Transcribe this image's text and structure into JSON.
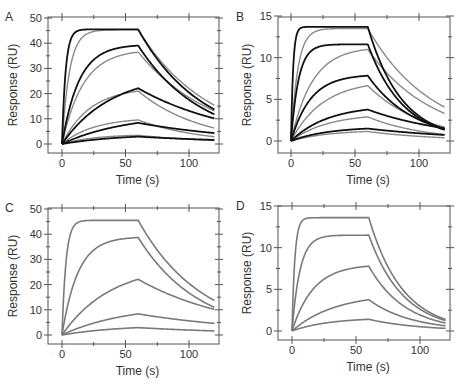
{
  "figure": {
    "panels": [
      "A",
      "B",
      "C",
      "D"
    ]
  },
  "chart_data": [
    {
      "panel": "A",
      "type": "line",
      "xlabel": "Time (s)",
      "ylabel": "Response (RU)",
      "xlim": [
        -8,
        125
      ],
      "ylim": [
        -2,
        50
      ],
      "xticks": [
        0,
        50,
        100
      ],
      "yticks": [
        0,
        10,
        20,
        30,
        40,
        50
      ],
      "injection_end_s": 60,
      "end_s": 120,
      "grid": false,
      "legend": "none",
      "series_groups": [
        {
          "name": "fit",
          "color": "#111111",
          "width": 1.8,
          "curves": [
            {
              "plateau": 45.5,
              "kon": 0.35,
              "koff": 0.02
            },
            {
              "plateau": 39.5,
              "kon": 0.075,
              "koff": 0.02
            },
            {
              "plateau": 28.0,
              "kon": 0.026,
              "koff": 0.013
            },
            {
              "plateau": 12.0,
              "kon": 0.02,
              "koff": 0.011
            },
            {
              "plateau": 4.0,
              "kon": 0.022,
              "koff": 0.01
            }
          ]
        },
        {
          "name": "data",
          "color": "#8a8a8a",
          "width": 1.4,
          "curves": [
            {
              "plateau": 45.3,
              "kon": 0.17,
              "koff": 0.018
            },
            {
              "plateau": 37.5,
              "kon": 0.06,
              "koff": 0.017
            },
            {
              "plateau": 22.5,
              "kon": 0.045,
              "koff": 0.02
            },
            {
              "plateau": 10.5,
              "kon": 0.04,
              "koff": 0.02
            },
            {
              "plateau": 3.8,
              "kon": 0.04,
              "koff": 0.015
            }
          ]
        }
      ]
    },
    {
      "panel": "B",
      "type": "line",
      "xlabel": "Time (s)",
      "ylabel": "Response (RU)",
      "xlim": [
        -8,
        127
      ],
      "ylim": [
        -0.6,
        15
      ],
      "xticks": [
        0,
        50,
        100
      ],
      "yticks": [
        0,
        5,
        10,
        15
      ],
      "injection_end_s": 60,
      "end_s": 120,
      "grid": false,
      "legend": "none",
      "series_groups": [
        {
          "name": "fit",
          "color": "#111111",
          "width": 1.8,
          "curves": [
            {
              "plateau": 13.7,
              "kon": 0.6,
              "koff": 0.038
            },
            {
              "plateau": 11.6,
              "kon": 0.17,
              "koff": 0.036
            },
            {
              "plateau": 8.0,
              "kon": 0.065,
              "koff": 0.028
            },
            {
              "plateau": 4.3,
              "kon": 0.035,
              "koff": 0.015
            },
            {
              "plateau": 1.7,
              "kon": 0.035,
              "koff": 0.012
            }
          ]
        },
        {
          "name": "data",
          "color": "#8a8a8a",
          "width": 1.4,
          "curves": [
            {
              "plateau": 13.5,
              "kon": 0.19,
              "koff": 0.02
            },
            {
              "plateau": 11.3,
              "kon": 0.06,
              "koff": 0.02
            },
            {
              "plateau": 7.3,
              "kon": 0.04,
              "koff": 0.023
            },
            {
              "plateau": 3.3,
              "kon": 0.035,
              "koff": 0.022
            },
            {
              "plateau": 1.3,
              "kon": 0.035,
              "koff": 0.018
            }
          ]
        }
      ]
    },
    {
      "panel": "C",
      "type": "line",
      "xlabel": "Time (s)",
      "ylabel": "Response (RU)",
      "xlim": [
        -8,
        125
      ],
      "ylim": [
        -2,
        50
      ],
      "xticks": [
        0,
        50,
        100
      ],
      "yticks": [
        0,
        10,
        20,
        30,
        40,
        50
      ],
      "injection_end_s": 60,
      "end_s": 120,
      "grid": false,
      "legend": "none",
      "series_groups": [
        {
          "name": "simulated",
          "color": "#7a7a7a",
          "width": 1.6,
          "curves": [
            {
              "plateau": 45.5,
              "kon": 0.32,
              "koff": 0.02
            },
            {
              "plateau": 39.0,
              "kon": 0.08,
              "koff": 0.021
            },
            {
              "plateau": 28.0,
              "kon": 0.026,
              "koff": 0.013
            },
            {
              "plateau": 12.0,
              "kon": 0.02,
              "koff": 0.01
            },
            {
              "plateau": 4.0,
              "kon": 0.022,
              "koff": 0.01
            }
          ]
        }
      ]
    },
    {
      "panel": "D",
      "type": "line",
      "xlabel": "Time (s)",
      "ylabel": "Response (RU)",
      "xlim": [
        -8,
        125
      ],
      "ylim": [
        -0.6,
        15
      ],
      "xticks": [
        0,
        50,
        100
      ],
      "yticks": [
        0,
        5,
        10,
        15
      ],
      "injection_end_s": 60,
      "end_s": 120,
      "grid": false,
      "legend": "none",
      "series_groups": [
        {
          "name": "simulated",
          "color": "#7a7a7a",
          "width": 1.6,
          "curves": [
            {
              "plateau": 13.6,
              "kon": 0.45,
              "koff": 0.038
            },
            {
              "plateau": 11.5,
              "kon": 0.16,
              "koff": 0.037
            },
            {
              "plateau": 8.0,
              "kon": 0.06,
              "koff": 0.035
            },
            {
              "plateau": 4.5,
              "kon": 0.03,
              "koff": 0.03
            },
            {
              "plateau": 1.6,
              "kon": 0.035,
              "koff": 0.025
            }
          ]
        }
      ]
    }
  ],
  "layout": {
    "panels": [
      {
        "left": 48,
        "top": 17,
        "right": 219,
        "bottom": 153,
        "x0": 62,
        "x100": 189,
        "y_top_val_px": 18,
        "y_zero_px": 144
      },
      {
        "left": 278,
        "top": 17,
        "right": 450,
        "bottom": 153,
        "x0": 291,
        "x100": 419,
        "y_top_val_px": 16,
        "y_zero_px": 141
      },
      {
        "left": 48,
        "top": 208,
        "right": 219,
        "bottom": 344,
        "x0": 62,
        "x100": 189,
        "y_top_val_px": 209,
        "y_zero_px": 335
      },
      {
        "left": 278,
        "top": 206,
        "right": 450,
        "bottom": 340,
        "x0": 292,
        "x100": 420,
        "y_top_val_px": 206,
        "y_zero_px": 331
      }
    ]
  }
}
